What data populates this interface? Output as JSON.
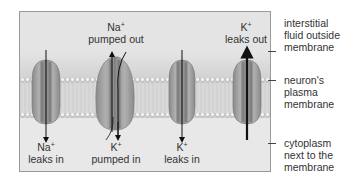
{
  "diagram": {
    "channel_labels": {
      "na_pumped_out": {
        "ion": "Na",
        "charge": "+",
        "text": "pumped out"
      },
      "k_leaks_out": {
        "ion": "K",
        "charge": "+",
        "text": "leaks out"
      },
      "na_leaks_in": {
        "ion": "Na",
        "charge": "+",
        "text": "leaks in"
      },
      "k_pumped_in": {
        "ion": "K",
        "charge": "+",
        "text": "pumped in"
      },
      "k_leaks_in": {
        "ion": "K",
        "charge": "+",
        "text": "leaks in"
      }
    },
    "side_labels": {
      "outside": [
        "interstitial",
        "fluid outside",
        "membrane"
      ],
      "membrane": [
        "neuron's",
        "plasma",
        "membrane"
      ],
      "cytoplasm": [
        "cytoplasm",
        "next to the",
        "membrane"
      ]
    },
    "colors": {
      "background": "#e6e6e6",
      "protein": "#9c9c9c",
      "protein_dark": "#6e6e6e",
      "lipid_head": "#f2f2f2",
      "arrow": "#111111"
    }
  }
}
